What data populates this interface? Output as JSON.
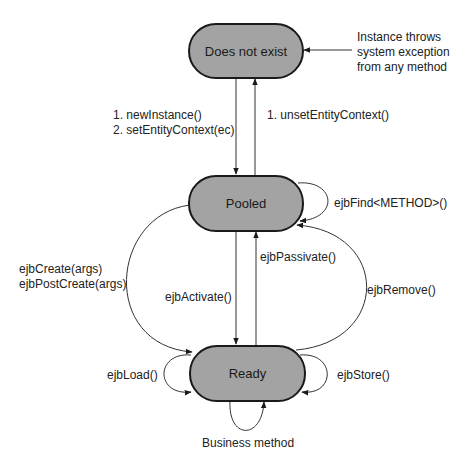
{
  "diagram": {
    "states": [
      {
        "id": "does-not-exist",
        "label": "Does not exist"
      },
      {
        "id": "pooled",
        "label": "Pooled"
      },
      {
        "id": "ready",
        "label": "Ready"
      }
    ],
    "transitions": [
      {
        "from": "does-not-exist",
        "to": "pooled",
        "label_lines": [
          "1. newInstance()",
          "2. setEntityContext(ec)"
        ]
      },
      {
        "from": "pooled",
        "to": "does-not-exist",
        "label": "1. unsetEntityContext()"
      },
      {
        "from": "pooled",
        "to": "pooled",
        "label": "ejbFind<METHOD>()"
      },
      {
        "from": "pooled",
        "to": "ready",
        "label_lines": [
          "ejbCreate(args)",
          "ejbPostCreate(args)"
        ]
      },
      {
        "from": "pooled",
        "to": "ready",
        "label": "ejbActivate()"
      },
      {
        "from": "ready",
        "to": "pooled",
        "label": "ejbPassivate()"
      },
      {
        "from": "ready",
        "to": "pooled",
        "label": "ejbRemove()"
      },
      {
        "from": "ready",
        "to": "ready",
        "label": "ejbLoad()"
      },
      {
        "from": "ready",
        "to": "ready",
        "label": "ejbStore()"
      },
      {
        "from": "ready",
        "to": "ready",
        "label": "Business method"
      },
      {
        "from": "external",
        "to": "does-not-exist",
        "label_lines": [
          "Instance throws",
          "system exception",
          "from any method"
        ]
      }
    ],
    "colors": {
      "state_fill": "#a3a3a3",
      "stroke": "#1a1a1a",
      "background": "#ffffff"
    }
  }
}
